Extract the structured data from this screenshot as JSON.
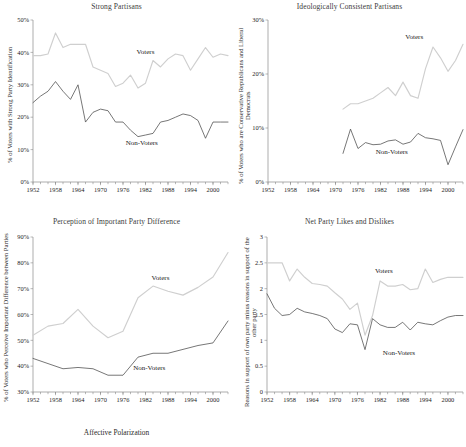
{
  "figure": {
    "caption": "Affective Polarization",
    "series_names": {
      "voters": "Voters",
      "nonvoters": "Non-Voters"
    },
    "colors": {
      "voters": "#cfcfcf",
      "nonvoters": "#4a4a4a",
      "axis": "#8a8a8a",
      "text": "#1a1a1a"
    }
  },
  "chart_data": [
    {
      "id": "strong-partisans",
      "type": "line",
      "title": "Strong Partisans",
      "xlabel": "",
      "ylabel": "% of Voters with Strong Party Identification",
      "xlim": [
        1952,
        2004
      ],
      "ylim": [
        0,
        50
      ],
      "yticks": [
        "0%",
        "10%",
        "20%",
        "30%",
        "40%",
        "50%"
      ],
      "ytickvals": [
        0,
        10,
        20,
        30,
        40,
        50
      ],
      "xticks": [
        "1952",
        "1958",
        "1964",
        "1970",
        "1976",
        "1982",
        "1988",
        "1994",
        "2000"
      ],
      "xtickvals": [
        1952,
        1958,
        1964,
        1970,
        1976,
        1982,
        1988,
        1994,
        2000
      ],
      "minor_tick_step": 2,
      "grid": false,
      "legend_position": "inline-annotation",
      "series": [
        {
          "name": "Voters",
          "label_x": 1982,
          "label_y": 39.5,
          "x": [
            1952,
            1954,
            1956,
            1958,
            1960,
            1962,
            1964,
            1966,
            1968,
            1970,
            1972,
            1974,
            1976,
            1978,
            1980,
            1982,
            1984,
            1986,
            1988,
            1990,
            1992,
            1994,
            1996,
            1998,
            2000,
            2002,
            2004
          ],
          "values": [
            39.0,
            39.0,
            39.5,
            46.0,
            41.5,
            42.5,
            42.5,
            42.5,
            35.5,
            34.5,
            33.5,
            29.5,
            30.5,
            33.0,
            29.0,
            30.5,
            37.5,
            35.5,
            38.0,
            39.5,
            39.0,
            34.5,
            38.0,
            41.5,
            38.5,
            39.5,
            39.0
          ]
        },
        {
          "name": "Non-Voters",
          "label_x": 1981,
          "label_y": 11.5,
          "x": [
            1952,
            1954,
            1956,
            1958,
            1960,
            1962,
            1964,
            1966,
            1968,
            1970,
            1972,
            1974,
            1976,
            1978,
            1980,
            1982,
            1984,
            1986,
            1988,
            1990,
            1992,
            1994,
            1996,
            1998,
            2000,
            2002,
            2004
          ],
          "values": [
            24.5,
            26.5,
            28.0,
            31.0,
            28.0,
            25.5,
            30.0,
            18.5,
            21.5,
            22.5,
            22.0,
            18.5,
            18.5,
            16.0,
            14.0,
            14.5,
            15.0,
            18.5,
            19.0,
            20.0,
            21.0,
            20.5,
            19.0,
            13.5,
            18.5,
            18.5,
            18.5
          ]
        }
      ]
    },
    {
      "id": "ideologically-consistent-partisans",
      "type": "line",
      "title": "Ideologically Consistent Partisans",
      "xlabel": "",
      "ylabel": "% of Voters who are Conservative Republicans and Liberal Democrats",
      "xlim": [
        1952,
        2004
      ],
      "ylim": [
        0,
        30
      ],
      "yticks": [
        "0%",
        "10%",
        "20%",
        "30%"
      ],
      "ytickvals": [
        0,
        10,
        20,
        30
      ],
      "xticks": [
        "1952",
        "1958",
        "1964",
        "1970",
        "1976",
        "1982",
        "1988",
        "1994",
        "2000"
      ],
      "xtickvals": [
        1952,
        1958,
        1964,
        1970,
        1976,
        1982,
        1988,
        1994,
        2000
      ],
      "minor_tick_step": 2,
      "grid": false,
      "legend_position": "inline-annotation",
      "series": [
        {
          "name": "Voters",
          "label_x": 1991,
          "label_y": 26.5,
          "x": [
            1972,
            1974,
            1976,
            1978,
            1980,
            1982,
            1984,
            1986,
            1988,
            1990,
            1992,
            1994,
            1996,
            1998,
            2000,
            2002,
            2004
          ],
          "values": [
            13.5,
            14.5,
            14.5,
            15.0,
            15.5,
            16.5,
            17.5,
            16.0,
            18.5,
            16.0,
            15.5,
            21.0,
            25.0,
            23.0,
            20.5,
            22.5,
            25.5
          ]
        },
        {
          "name": "Non-Voters",
          "label_x": 1985,
          "label_y": 5.2,
          "x": [
            1972,
            1974,
            1976,
            1978,
            1980,
            1982,
            1984,
            1986,
            1988,
            1990,
            1992,
            1994,
            1996,
            1998,
            2000,
            2002,
            2004
          ],
          "values": [
            5.3,
            9.8,
            6.2,
            7.3,
            6.9,
            7.0,
            7.6,
            7.8,
            7.0,
            7.4,
            9.0,
            8.2,
            8.0,
            7.7,
            3.2,
            6.5,
            9.7
          ]
        }
      ]
    },
    {
      "id": "perception-of-important-party-difference",
      "type": "line",
      "title": "Perception of Important Party Difference",
      "xlabel": "",
      "ylabel": "% of Voters who Perceive Important Difference between Parties",
      "xlim": [
        1952,
        2004
      ],
      "ylim": [
        30,
        90
      ],
      "yticks": [
        "30%",
        "40%",
        "50%",
        "60%",
        "70%",
        "80%",
        "90%"
      ],
      "ytickvals": [
        30,
        40,
        50,
        60,
        70,
        80,
        90
      ],
      "xticks": [
        "1952",
        "1958",
        "1964",
        "1970",
        "1976",
        "1982",
        "1988",
        "1994",
        "2000"
      ],
      "xtickvals": [
        1952,
        1958,
        1964,
        1970,
        1976,
        1982,
        1988,
        1994,
        2000
      ],
      "minor_tick_step": 2,
      "grid": false,
      "legend_position": "inline-annotation",
      "series": [
        {
          "name": "Voters",
          "label_x": 1986,
          "label_y": 73.5,
          "x": [
            1952,
            1956,
            1960,
            1964,
            1968,
            1972,
            1976,
            1980,
            1984,
            1988,
            1992,
            1996,
            2000,
            2004
          ],
          "values": [
            52.0,
            55.5,
            56.5,
            62.0,
            55.5,
            51.0,
            53.5,
            66.5,
            71.0,
            69.0,
            67.5,
            70.5,
            74.5,
            84.0
          ]
        },
        {
          "name": "Non-Voters",
          "label_x": 1983,
          "label_y": 38.5,
          "x": [
            1952,
            1956,
            1960,
            1964,
            1968,
            1972,
            1976,
            1980,
            1984,
            1988,
            1992,
            1996,
            2000,
            2004
          ],
          "values": [
            43.0,
            41.0,
            39.0,
            39.5,
            39.0,
            36.5,
            36.5,
            43.5,
            45.0,
            45.0,
            46.5,
            48.0,
            49.0,
            57.5
          ]
        }
      ]
    },
    {
      "id": "net-party-likes-and-dislikes",
      "type": "line",
      "title": "Net Party Likes and Dislikes",
      "xlabel": "",
      "ylabel": "Reasons in support of own party minus reasons in support of the other party",
      "xlim": [
        1952,
        2004
      ],
      "ylim": [
        0,
        3
      ],
      "yticks": [
        "0",
        "0.5",
        "1",
        "1.5",
        "2",
        "2.5",
        "3"
      ],
      "ytickvals": [
        0,
        0.5,
        1,
        1.5,
        2,
        2.5,
        3
      ],
      "xticks": [
        "1952",
        "1958",
        "1964",
        "1970",
        "1976",
        "1982",
        "1988",
        "1994",
        "2000"
      ],
      "xtickvals": [
        1952,
        1958,
        1964,
        1970,
        1976,
        1982,
        1988,
        1994,
        2000
      ],
      "minor_tick_step": 2,
      "grid": false,
      "legend_position": "inline-annotation",
      "series": [
        {
          "name": "Voters",
          "label_x": 1983,
          "label_y": 2.3,
          "x": [
            1952,
            1954,
            1956,
            1958,
            1960,
            1962,
            1964,
            1966,
            1968,
            1970,
            1972,
            1974,
            1976,
            1978,
            1980,
            1982,
            1984,
            1986,
            1988,
            1990,
            1992,
            1994,
            1996,
            1998,
            2000,
            2002,
            2004
          ],
          "values": [
            2.5,
            2.5,
            2.5,
            2.15,
            2.38,
            2.22,
            2.1,
            2.08,
            2.05,
            1.92,
            1.8,
            1.6,
            1.72,
            1.1,
            1.48,
            2.15,
            2.05,
            2.05,
            2.08,
            1.98,
            2.0,
            2.38,
            2.12,
            2.18,
            2.22,
            2.22,
            2.22
          ]
        },
        {
          "name": "Non-Voters",
          "label_x": 1987,
          "label_y": 0.72,
          "x": [
            1952,
            1954,
            1956,
            1958,
            1960,
            1962,
            1964,
            1966,
            1968,
            1970,
            1972,
            1974,
            1976,
            1978,
            1980,
            1982,
            1984,
            1986,
            1988,
            1990,
            1992,
            1994,
            1996,
            1998,
            2000,
            2002,
            2004
          ],
          "values": [
            1.9,
            1.62,
            1.48,
            1.5,
            1.62,
            1.55,
            1.52,
            1.48,
            1.42,
            1.22,
            1.15,
            1.32,
            1.3,
            0.82,
            1.42,
            1.3,
            1.25,
            1.25,
            1.35,
            1.2,
            1.35,
            1.32,
            1.3,
            1.38,
            1.45,
            1.48,
            1.48
          ]
        }
      ]
    }
  ]
}
